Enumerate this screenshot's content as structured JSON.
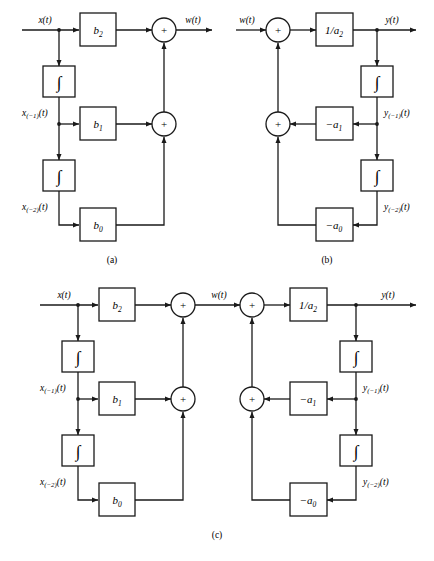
{
  "figure": {
    "background_color": "#ffffff",
    "stroke_color": "#1a1a1a",
    "box_fill": "#ffffff",
    "width": 434,
    "height": 561,
    "captions": [
      {
        "id": "cap_a",
        "text": "(a)"
      },
      {
        "id": "cap_b",
        "text": "(b)"
      },
      {
        "id": "cap_c",
        "text": "(c)"
      }
    ],
    "glyphs": {
      "integrator": "∫",
      "summer": "+",
      "arrowhead": "solid-triangle"
    },
    "panel_a": {
      "name": "feedforward-section",
      "signals": {
        "input": "x(t)",
        "output": "w(t)",
        "state1": "x",
        "state1_sub": "(−1)",
        "state1_tail": "(t)",
        "state2": "x",
        "state2_sub": "(−2)",
        "state2_tail": "(t)"
      },
      "gain_blocks": [
        {
          "name": "gain-b2",
          "base": "b",
          "sub": "2"
        },
        {
          "name": "gain-b1",
          "base": "b",
          "sub": "1"
        },
        {
          "name": "gain-b0",
          "base": "b",
          "sub": "0"
        }
      ],
      "integrators": [
        {
          "name": "integrator-1",
          "symbol": "∫"
        },
        {
          "name": "integrator-2",
          "symbol": "∫"
        }
      ],
      "summers": [
        {
          "name": "summer-top",
          "symbol": "+"
        },
        {
          "name": "summer-mid",
          "symbol": "+"
        }
      ]
    },
    "panel_b": {
      "name": "feedback-section",
      "signals": {
        "input": "w(t)",
        "output": "y(t)",
        "state1": "y",
        "state1_sub": "(−1)",
        "state1_tail": "(t)",
        "state2": "y",
        "state2_sub": "(−2)",
        "state2_tail": "(t)"
      },
      "gain_blocks": [
        {
          "name": "gain-inv-a2",
          "base": "1/a",
          "sub": "2"
        },
        {
          "name": "gain-neg-a1",
          "base": "−a",
          "sub": "1"
        },
        {
          "name": "gain-neg-a0",
          "base": "−a",
          "sub": "0"
        }
      ],
      "integrators": [
        {
          "name": "integrator-1",
          "symbol": "∫"
        },
        {
          "name": "integrator-2",
          "symbol": "∫"
        }
      ],
      "summers": [
        {
          "name": "summer-top",
          "symbol": "+"
        },
        {
          "name": "summer-mid",
          "symbol": "+"
        }
      ]
    },
    "panel_c": {
      "name": "cascaded-full-realization",
      "signals": {
        "input": "x(t)",
        "intermediate": "w(t)",
        "output": "y(t)",
        "x_state1": "x",
        "x_state1_sub": "(−1)",
        "x_state1_tail": "(t)",
        "x_state2": "x",
        "x_state2_sub": "(−2)",
        "x_state2_tail": "(t)",
        "y_state1": "y",
        "y_state1_sub": "(−1)",
        "y_state1_tail": "(t)",
        "y_state2": "y",
        "y_state2_sub": "(−2)",
        "y_state2_tail": "(t)"
      },
      "gain_blocks": [
        {
          "name": "gain-b2",
          "base": "b",
          "sub": "2"
        },
        {
          "name": "gain-b1",
          "base": "b",
          "sub": "1"
        },
        {
          "name": "gain-b0",
          "base": "b",
          "sub": "0"
        },
        {
          "name": "gain-inv-a2",
          "base": "1/a",
          "sub": "2"
        },
        {
          "name": "gain-neg-a1",
          "base": "−a",
          "sub": "1"
        },
        {
          "name": "gain-neg-a0",
          "base": "−a",
          "sub": "0"
        }
      ],
      "integrators": [
        {
          "name": "integrator-x1",
          "symbol": "∫"
        },
        {
          "name": "integrator-x2",
          "symbol": "∫"
        },
        {
          "name": "integrator-y1",
          "symbol": "∫"
        },
        {
          "name": "integrator-y2",
          "symbol": "∫"
        }
      ],
      "summers": [
        {
          "name": "summer-ff-top",
          "symbol": "+"
        },
        {
          "name": "summer-ff-mid",
          "symbol": "+"
        },
        {
          "name": "summer-fb-top",
          "symbol": "+"
        },
        {
          "name": "summer-fb-mid",
          "symbol": "+"
        }
      ]
    }
  }
}
